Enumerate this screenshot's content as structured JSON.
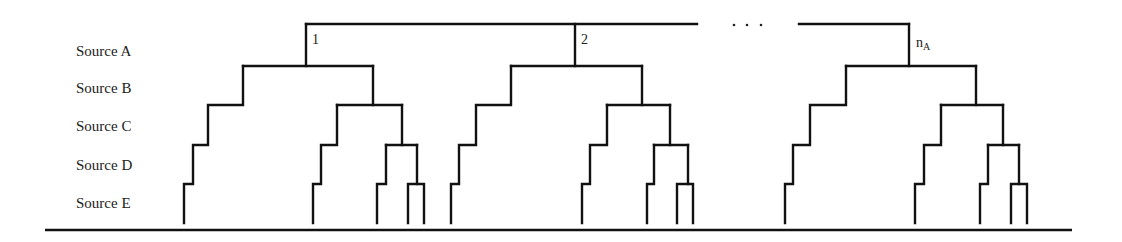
{
  "rows": [
    {
      "label": "Source A",
      "y": 44
    },
    {
      "label": "Source B",
      "y": 81
    },
    {
      "label": "Source C",
      "y": 119
    },
    {
      "label": "Source D",
      "y": 158
    },
    {
      "label": "Source E",
      "y": 196
    }
  ],
  "root": {
    "segments": [
      {
        "x1": 306,
        "x2": 697,
        "y": 24
      },
      {
        "x1": 799,
        "x2": 909,
        "y": 24
      }
    ],
    "ellipsis": [
      734,
      747,
      761
    ],
    "ellipsis_y": 25
  },
  "trees": [
    {
      "label": "1",
      "label_sub": "",
      "label_x": 312,
      "label_y": 33,
      "root_x": 306,
      "bar_b": [
        243,
        373
      ],
      "left": {
        "c": [
          208,
          243
        ],
        "d": [
          193,
          208
        ],
        "e": [
          184,
          193
        ]
      },
      "right": {
        "bar_c": [
          337,
          402
        ],
        "cl": {
          "d": [
            321,
            337
          ],
          "e": [
            313,
            321
          ]
        },
        "bar_d": [
          386,
          417
        ],
        "dl": {
          "e": [
            377,
            386
          ]
        },
        "bar_e": [
          408,
          424
        ]
      }
    },
    {
      "label": "2",
      "label_sub": "",
      "label_x": 581,
      "label_y": 33,
      "root_x": 575,
      "bar_b": [
        511,
        642
      ],
      "left": {
        "c": [
          476,
          511
        ],
        "d": [
          459,
          476
        ],
        "e": [
          451,
          459
        ]
      },
      "right": {
        "bar_c": [
          607,
          670
        ],
        "cl": {
          "d": [
            590,
            607
          ],
          "e": [
            582,
            590
          ]
        },
        "bar_d": [
          654,
          688
        ],
        "dl": {
          "e": [
            647,
            654
          ]
        },
        "bar_e": [
          677,
          693
        ]
      }
    },
    {
      "label": "n",
      "label_sub": "A",
      "label_x": 916,
      "label_y": 36,
      "root_x": 909,
      "bar_b": [
        846,
        976
      ],
      "left": {
        "c": [
          810,
          846
        ],
        "d": [
          793,
          810
        ],
        "e": [
          785,
          793
        ]
      },
      "right": {
        "bar_c": [
          941,
          1003
        ],
        "cl": {
          "d": [
            924,
            941
          ],
          "e": [
            915,
            924
          ]
        },
        "bar_d": [
          988,
          1019
        ],
        "dl": {
          "e": [
            980,
            988
          ]
        },
        "bar_e": [
          1011,
          1027
        ]
      }
    }
  ],
  "levels": {
    "top": 24,
    "b": 66,
    "c": 105,
    "d": 145,
    "e": 184,
    "leaf": 223
  },
  "baseline": {
    "x1": 45,
    "x2": 1072,
    "y": 230
  }
}
